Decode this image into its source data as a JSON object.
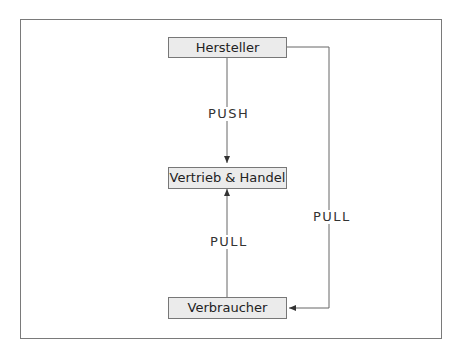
{
  "diagram": {
    "nodes": {
      "manufacturer": "Hersteller",
      "distribution": "Vertrieb & Handel",
      "consumer": "Verbraucher"
    },
    "edges": {
      "push": "PUSH",
      "pull_consumer_to_distribution": "PULL",
      "pull_manufacturer_to_consumer": "PULL"
    },
    "colors": {
      "node_fill": "#ebebeb",
      "line": "#555555"
    }
  }
}
